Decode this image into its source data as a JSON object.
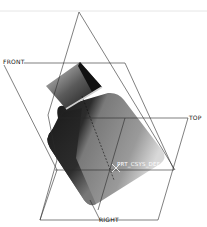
{
  "viewport": {
    "datum_planes": [
      {
        "name": "FRONT",
        "label": "FRONT"
      },
      {
        "name": "TOP",
        "label": "TOP"
      },
      {
        "name": "RIGHT",
        "label": "RIGHT"
      }
    ],
    "csys": {
      "label": "PRT_CSYS_DEF"
    },
    "colors": {
      "background": "#ffffff",
      "datum_line": "#2a2a2a",
      "model_dark": "#1a1a1a",
      "model_mid": "#6e6e6e",
      "model_light": "#bdbdbd"
    }
  }
}
